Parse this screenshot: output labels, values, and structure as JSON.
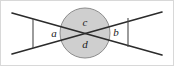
{
  "figure": {
    "width": 174,
    "height": 66,
    "background_color": "#ffffff",
    "border_color": "#d8d8d8"
  },
  "colors": {
    "line": "#2b2b2b",
    "circle_fill": "#cfcfcf",
    "circle_stroke": "#8c8c8c",
    "tick": "#4a4a4a",
    "label_text": "#1a1a1a"
  },
  "geometry": {
    "intersection": {
      "x": 85,
      "y": 33
    },
    "circle": {
      "cx": 85,
      "cy": 33,
      "r": 25
    },
    "line_1": {
      "name": "line-falling",
      "x1": 12,
      "y1": 13,
      "x2": 162,
      "y2": 55
    },
    "line_2": {
      "name": "line-rising",
      "x1": 12,
      "y1": 54,
      "x2": 162,
      "y2": 12
    },
    "tick_left": {
      "x1": 33,
      "y1": 19,
      "x2": 33,
      "y2": 48
    },
    "tick_right": {
      "x1": 128,
      "y1": 18,
      "x2": 128,
      "y2": 47
    }
  },
  "labels": {
    "top": {
      "text": "c",
      "x": 85,
      "y": 23
    },
    "bottom": {
      "text": "d",
      "x": 85,
      "y": 45
    },
    "left": {
      "text": "a",
      "x": 54,
      "y": 34
    },
    "right": {
      "text": "b",
      "x": 116,
      "y": 33
    }
  }
}
